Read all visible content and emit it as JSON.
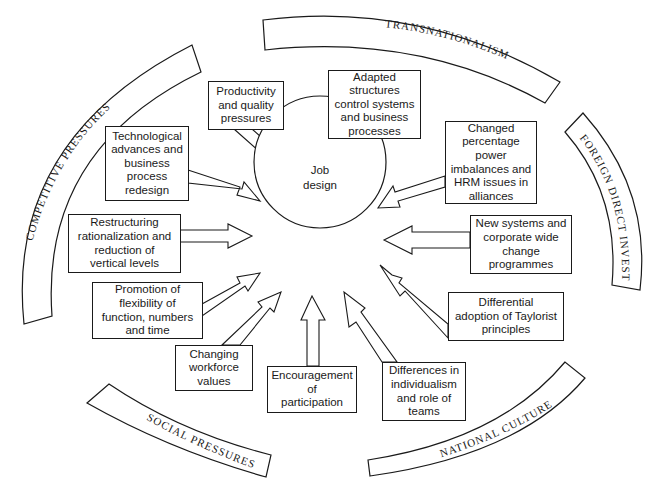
{
  "center": {
    "label": "Job\ndesign"
  },
  "influences": [
    {
      "id": "productivity",
      "label": "Productivity\nand quality\npressures"
    },
    {
      "id": "adapted",
      "label": "Adapted\nstructures\ncontrol systems\nand business\nprocesses"
    },
    {
      "id": "technological",
      "label": "Technological\nadvances and\nbusiness\nprocess\nredesign"
    },
    {
      "id": "changed",
      "label": "Changed\npercentage\npower\nimbalances and\nHRM issues in\nalliances"
    },
    {
      "id": "restructuring",
      "label": "Restructuring\nrationalization and\nreduction of\nvertical levels"
    },
    {
      "id": "new-systems",
      "label": "New systems and\ncorporate wide\nchange\nprogrammes"
    },
    {
      "id": "promotion",
      "label": "Promotion of\nflexibility of\nfunction, numbers\nand time"
    },
    {
      "id": "differential",
      "label": "Differential\nadoption of Taylorist\nprinciples"
    },
    {
      "id": "changing-workforce",
      "label": "Changing\nworkforce\nvalues"
    },
    {
      "id": "encouragement",
      "label": "Encouragement\nof\nparticipation"
    },
    {
      "id": "differences",
      "label": "Differences in\nindividualism\nand role of\nteams"
    }
  ],
  "pressures": {
    "transnationalism": "TRANSNATIONALISM",
    "competitive": "COMPETITIVE  PRESSURES",
    "foreign_direct_investment": "FOREIGN  DIRECT  INVESTMENT",
    "social": "SOCIAL  PRESSURES",
    "national_culture": "NATIONAL  CULTURE"
  }
}
